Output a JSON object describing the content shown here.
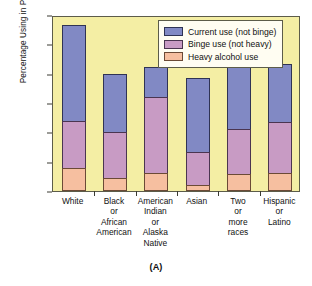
{
  "chart_data": {
    "type": "bar",
    "title": "",
    "caption": "(A)",
    "xlabel": "",
    "ylabel": "Percentage Using in Past Month",
    "ylim": [
      0,
      60
    ],
    "yticks": [
      0,
      10,
      20,
      30,
      40,
      50,
      60
    ],
    "grid": false,
    "stacked": true,
    "legend_position": "top-right",
    "categories": [
      "White",
      "Black or African American",
      "American Indian or Alaska Native",
      "Asian",
      "Two or more races",
      "Hispanic or Latino"
    ],
    "category_lines": [
      [
        "White"
      ],
      [
        "Black",
        "or",
        "African",
        "American"
      ],
      [
        "American",
        "Indian",
        "or",
        "Alaska",
        "Native"
      ],
      [
        "Asian"
      ],
      [
        "Two",
        "or",
        "more",
        "races"
      ],
      [
        "Hispanic",
        "or",
        "Latino"
      ]
    ],
    "series": [
      {
        "name": "Heavy alcohol use",
        "key": "heavy",
        "color": "#f6bfa0",
        "values": [
          7.8,
          4.3,
          6.0,
          2.1,
          5.8,
          6.2
        ]
      },
      {
        "name": "Binge use (not heavy)",
        "key": "binge",
        "color": "#c89bc4",
        "values": [
          16.0,
          15.9,
          26.2,
          11.1,
          15.5,
          17.5
        ]
      },
      {
        "name": "Current use (not binge)",
        "key": "current",
        "color": "#8189c4",
        "values": [
          32.7,
          19.8,
          10.1,
          25.4,
          24.8,
          19.5
        ]
      }
    ],
    "segment_boundaries": {
      "heavy_top": [
        7.8,
        4.3,
        6.0,
        2.1,
        5.8,
        6.2
      ],
      "binge_top": [
        23.8,
        20.2,
        32.2,
        13.2,
        21.3,
        23.7
      ],
      "bar_total": [
        56.5,
        40.0,
        42.3,
        38.6,
        46.1,
        43.2
      ]
    }
  },
  "legend": {
    "items": [
      {
        "label": "Current use (not binge)"
      },
      {
        "label": "Binge use (not heavy)"
      },
      {
        "label": "Heavy alcohol use"
      }
    ]
  },
  "colors": {
    "plot_background": "#f4eea4",
    "legend_background": "#fffdf2",
    "axis": "#5c5c4a",
    "current_use": "#8189c4",
    "binge_use": "#c89bc4",
    "heavy_use": "#f6bfa0"
  }
}
